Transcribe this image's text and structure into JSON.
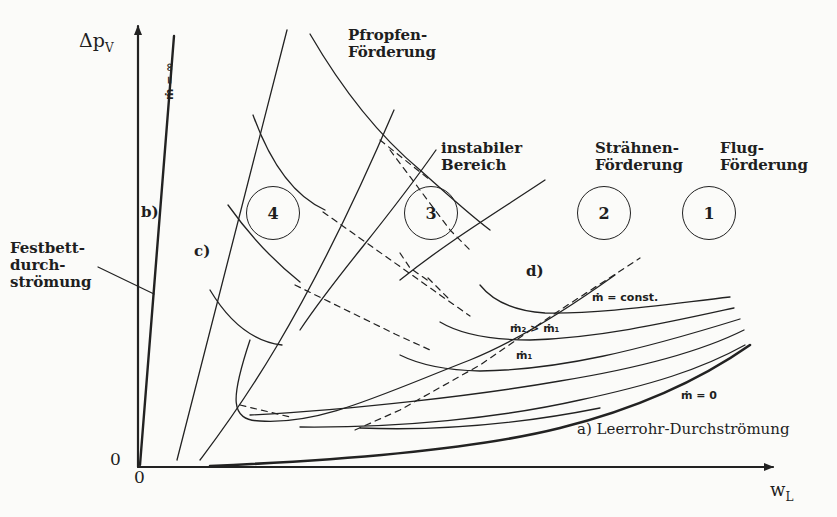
{
  "diagram": {
    "axes": {
      "y_label": "Δp",
      "y_label_sub": "V",
      "x_label": "w",
      "x_label_sub": "L",
      "origin_y": "0",
      "origin_x": "0"
    },
    "regions": [
      {
        "number": "4",
        "name_line1": "Pfropfen-",
        "name_line2": "Förderung"
      },
      {
        "number": "3",
        "name_line1": "instabiler",
        "name_line2": "Bereich"
      },
      {
        "number": "2",
        "name_line1": "Strähnen-",
        "name_line2": "Förderung"
      },
      {
        "number": "1",
        "name_line1": "Flug-",
        "name_line2": "Förderung"
      }
    ],
    "curve_labels": {
      "a": "a) Leerrohr-Durchströmung",
      "b": "b)",
      "c": "c)",
      "d": "d)",
      "festbett_line1": "Festbett-",
      "festbett_line2": "durch-",
      "festbett_line3": "strömung",
      "m_inf": "ṁ = ∞",
      "m_const": "ṁ = const.",
      "m2_gt_m1": "ṁ₂ > ṁ₁",
      "m1": "ṁ₁",
      "m_zero": "ṁ = 0"
    },
    "colors": {
      "line": "#222222",
      "background": "#fbfbf9"
    }
  }
}
